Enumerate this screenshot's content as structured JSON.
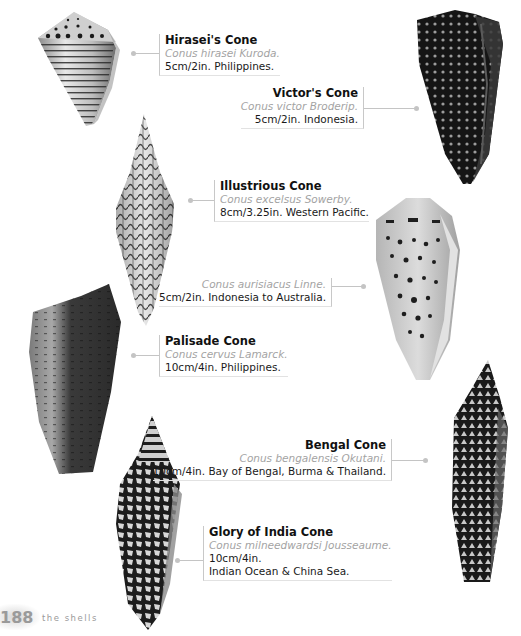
{
  "shells": [
    {
      "id": "hirasei",
      "name": "Hirasei's Cone",
      "scientific": "Conus hirasei Kuroda.",
      "info": [
        "5cm/2in. Philippines."
      ],
      "align": "left"
    },
    {
      "id": "victor",
      "name": "Victor's Cone",
      "scientific": "Conus victor Broderip.",
      "info": [
        "5cm/2in. Indonesia."
      ],
      "align": "right"
    },
    {
      "id": "illustrious",
      "name": "Illustrious Cone",
      "scientific": "Conus excelsus Sowerby.",
      "info": [
        "8cm/3.25in. Western Pacific."
      ],
      "align": "left"
    },
    {
      "id": "aurisiacus",
      "name": "",
      "scientific": "Conus aurisiacus Linne.",
      "info": [
        "5cm/2in. Indonesia to Australia."
      ],
      "align": "right"
    },
    {
      "id": "palisade",
      "name": "Palisade Cone",
      "scientific": "Conus cervus Lamarck.",
      "info": [
        "10cm/4in. Philippines."
      ],
      "align": "left"
    },
    {
      "id": "bengal",
      "name": "Bengal Cone",
      "scientific": "Conus bengalensis Okutani.",
      "info": [
        "10cm/4in. Bay of Bengal, Burma & Thailand."
      ],
      "align": "right"
    },
    {
      "id": "glory-of-india",
      "name": "Glory of India Cone",
      "scientific": "Conus milneedwardsi Jousseaume.",
      "info": [
        "10cm/4in.",
        "Indian Ocean & China Sea."
      ],
      "align": "left"
    }
  ],
  "footer": {
    "page_number": "188",
    "section_title": "the shells"
  },
  "icons": {
    "shell_image": "cone-shell-photo",
    "connector": "leader-line-dot"
  }
}
